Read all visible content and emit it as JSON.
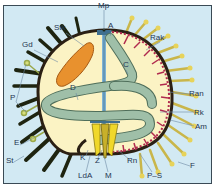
{
  "figure": {
    "colors": {
      "background": "#d2e9f3",
      "frame_border": "#3a4a55",
      "body_fill": "#fbf3c4",
      "test_wall": "#2b2014",
      "gonad": "#e8912e",
      "gut": "#9fbfa8",
      "gut_outline": "#4f6e5a",
      "spine_dark": "#1e2410",
      "tube_feet": "#e7d35a",
      "ambulacral": "#b02a4e",
      "lantern": "#f0d82a",
      "canal": "#7fb3d4",
      "label": "#1f3550"
    }
  },
  "labels": [
    {
      "id": "mp",
      "text": "Mp",
      "x": 98,
      "y": 2
    },
    {
      "id": "a",
      "text": "A",
      "x": 108,
      "y": 22
    },
    {
      "id": "stk",
      "text": "Stk",
      "x": 54,
      "y": 24
    },
    {
      "id": "gd",
      "text": "Gd",
      "x": 22,
      "y": 41
    },
    {
      "id": "rak",
      "text": "Rak",
      "x": 150,
      "y": 34
    },
    {
      "id": "c",
      "text": "C",
      "x": 123,
      "y": 61
    },
    {
      "id": "d",
      "text": "D",
      "x": 70,
      "y": 84
    },
    {
      "id": "ran",
      "text": "Ran",
      "x": 189,
      "y": 90
    },
    {
      "id": "p",
      "text": "P",
      "x": 10,
      "y": 94
    },
    {
      "id": "rk",
      "text": "Rk",
      "x": 194,
      "y": 109
    },
    {
      "id": "am",
      "text": "Am",
      "x": 195,
      "y": 123
    },
    {
      "id": "e",
      "text": "E",
      "x": 14,
      "y": 139
    },
    {
      "id": "st",
      "text": "St",
      "x": 6,
      "y": 157
    },
    {
      "id": "k",
      "text": "K",
      "x": 80,
      "y": 154
    },
    {
      "id": "z",
      "text": "Z",
      "x": 95,
      "y": 157
    },
    {
      "id": "rn",
      "text": "Rn",
      "x": 127,
      "y": 157
    },
    {
      "id": "f",
      "text": "F",
      "x": 190,
      "y": 162
    },
    {
      "id": "lda",
      "text": "LdA",
      "x": 78,
      "y": 172
    },
    {
      "id": "m",
      "text": "M",
      "x": 105,
      "y": 172
    },
    {
      "id": "p_s",
      "text": "P–S",
      "x": 147,
      "y": 172
    }
  ]
}
